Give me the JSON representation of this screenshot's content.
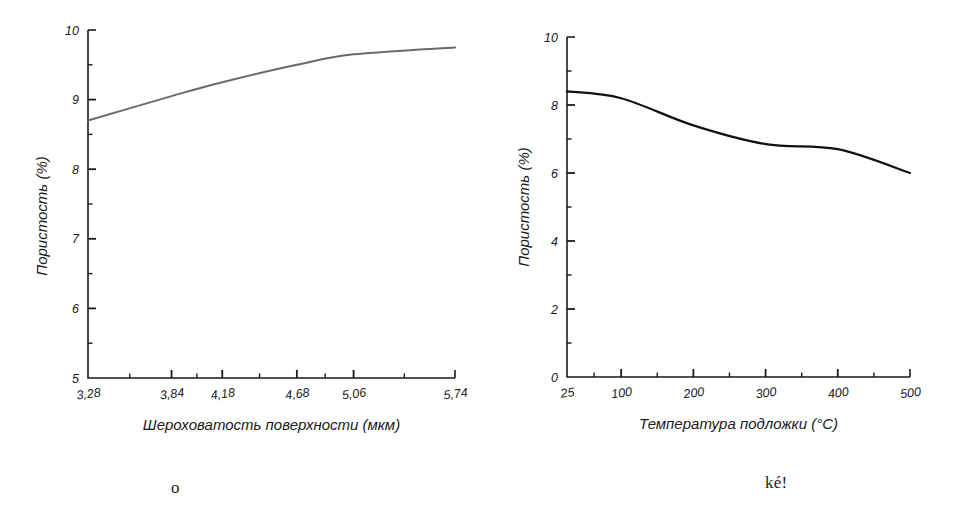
{
  "page": {
    "background": "#ffffff",
    "width": 974,
    "height": 532
  },
  "captions": {
    "left": "o",
    "right": "ké!"
  },
  "chart_data": [
    {
      "id": "porosity-vs-roughness",
      "type": "line",
      "title": "",
      "xlabel": "Шероховатость поверхности (мкм)",
      "ylabel": "Пористость (%)",
      "xtick_labels": [
        "3,28",
        "3,84",
        "4,18",
        "4,68",
        "5,06",
        "5,74"
      ],
      "x": [
        3.28,
        3.84,
        4.18,
        4.68,
        5.06,
        5.74
      ],
      "values": [
        8.7,
        9.05,
        9.25,
        9.5,
        9.65,
        9.75
      ],
      "ytick_labels": [
        "5",
        "6",
        "7",
        "8",
        "9",
        "10"
      ],
      "yticks": [
        5,
        6,
        7,
        8,
        9,
        10
      ],
      "ylim": [
        5,
        10
      ],
      "xlim": [
        3.28,
        5.74
      ],
      "grid": false,
      "legend": false,
      "line_color": "#6a6a6a",
      "line_width": 2.0,
      "minor_ticks": true,
      "axis_style": "L-spine"
    },
    {
      "id": "porosity-vs-substrate-temperature",
      "type": "line",
      "title": "",
      "xlabel": "Температура подложки (°C)",
      "ylabel": "Пористость (%)",
      "xtick_labels": [
        "25",
        "100",
        "200",
        "300",
        "400",
        "500"
      ],
      "x": [
        25,
        100,
        200,
        300,
        400,
        500
      ],
      "values": [
        8.4,
        8.2,
        7.4,
        6.85,
        6.7,
        6.0
      ],
      "ytick_labels": [
        "0",
        "2",
        "4",
        "6",
        "8",
        "10"
      ],
      "yticks": [
        0,
        2,
        4,
        6,
        8,
        10
      ],
      "ylim": [
        0,
        10
      ],
      "xlim": [
        25,
        500
      ],
      "grid": false,
      "legend": false,
      "line_color": "#111111",
      "line_width": 2.2,
      "minor_ticks": true,
      "axis_style": "L-spine"
    }
  ]
}
